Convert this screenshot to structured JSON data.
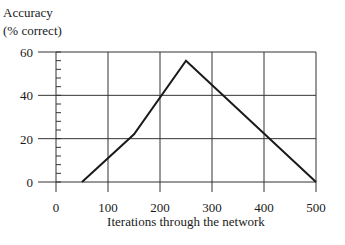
{
  "chart_data": {
    "type": "line",
    "title": "",
    "ylabel_line1": "Accuracy",
    "ylabel_line2": "(% correct)",
    "xlabel": "Iterations through the network",
    "x_ticks": [
      "0",
      "100",
      "200",
      "300",
      "400",
      "500"
    ],
    "y_ticks": [
      "0",
      "20",
      "40",
      "60"
    ],
    "xlim": [
      0,
      500
    ],
    "ylim": [
      0,
      60
    ],
    "grid": true,
    "series": [
      {
        "name": "Accuracy",
        "x": [
          50,
          150,
          250,
          500
        ],
        "y": [
          0,
          22,
          56,
          0
        ]
      }
    ]
  }
}
